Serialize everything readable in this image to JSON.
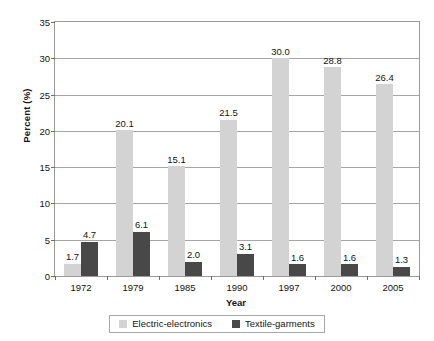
{
  "chart_data": {
    "type": "bar",
    "title": "",
    "subtitle": "",
    "xlabel": "Year",
    "ylabel": "Percent (%)",
    "categories": [
      "1972",
      "1979",
      "1985",
      "1990",
      "1997",
      "2000",
      "2005"
    ],
    "series": [
      {
        "name": "Electric-electronics",
        "color": "#d3d3d3",
        "values": [
          1.7,
          20.1,
          15.1,
          21.5,
          30.0,
          28.8,
          26.4
        ],
        "labels": [
          "1.7",
          "20.1",
          "15.1",
          "21.5",
          "30.0",
          "28.8",
          "26.4"
        ]
      },
      {
        "name": "Textile-garments",
        "color": "#484848",
        "values": [
          4.7,
          6.1,
          2.0,
          3.1,
          1.6,
          1.6,
          1.3
        ],
        "labels": [
          "4.7",
          "6.1",
          "2.0",
          "3.1",
          "1.6",
          "1.6",
          "1.3"
        ]
      }
    ],
    "ylim": [
      0,
      35
    ],
    "ytick_step": 5,
    "yticks": [
      0,
      5,
      10,
      15,
      20,
      25,
      30,
      35
    ],
    "ytick_labels": [
      "0",
      "5",
      "10",
      "15",
      "20",
      "25",
      "30",
      "35"
    ],
    "grid": "horizontal",
    "legend_position": "bottom",
    "data_labels": true
  },
  "axes": {
    "y_title": "Percent (%)",
    "x_title": "Year"
  },
  "legend": {
    "entries": [
      {
        "label": "Electric-electronics",
        "swatch": "series-a"
      },
      {
        "label": "Textile-garments",
        "swatch": "series-b"
      }
    ]
  }
}
